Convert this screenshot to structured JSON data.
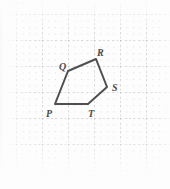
{
  "figure": {
    "header_crumb": "4.21",
    "caption": "",
    "canvas": {
      "width": 170,
      "height": 189
    },
    "background_color": "#fdfdfd",
    "edge_rule_color": "#3a3a3a"
  },
  "grid": {
    "type": "dotted-graph-paper",
    "minor_spacing_px": 6.5,
    "major_spacing_px": 26,
    "minor_color": "#dcdcdc",
    "major_color": "#bcbcbc",
    "origin_x_px": 16,
    "origin_y_px": 14,
    "visible": true
  },
  "shape": {
    "name": "pentagon-pqrst",
    "kind": "polygon",
    "sides": 5,
    "stroke_color": "#4f4f4f",
    "stroke_width_px": 2,
    "fill": "none",
    "vertices": [
      {
        "id": "P",
        "label": "P",
        "x": 55,
        "y": 104,
        "label_x": 46,
        "label_y": 109
      },
      {
        "id": "Q",
        "label": "Q",
        "x": 68,
        "y": 71,
        "label_x": 59,
        "label_y": 62
      },
      {
        "id": "R",
        "label": "R",
        "x": 96,
        "y": 59,
        "label_x": 97,
        "label_y": 48
      },
      {
        "id": "S",
        "label": "S",
        "x": 107,
        "y": 87,
        "label_x": 112,
        "label_y": 83
      },
      {
        "id": "T",
        "label": "T",
        "x": 88,
        "y": 104,
        "label_x": 88,
        "label_y": 109
      }
    ],
    "edges": [
      {
        "from": "P",
        "to": "Q"
      },
      {
        "from": "Q",
        "to": "R"
      },
      {
        "from": "R",
        "to": "S"
      },
      {
        "from": "S",
        "to": "T"
      },
      {
        "from": "T",
        "to": "P"
      }
    ]
  },
  "labels": {
    "P": "P",
    "Q": "Q",
    "R": "R",
    "S": "S",
    "T": "T"
  }
}
